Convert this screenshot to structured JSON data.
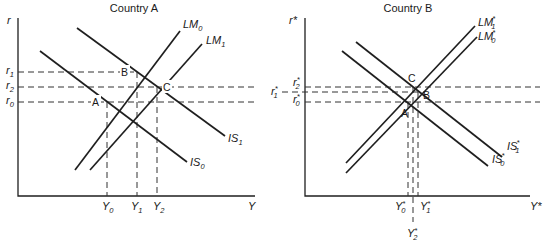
{
  "panels": [
    {
      "title": "Country A",
      "y_axis_label": "r",
      "x_axis_label": "Y",
      "curves": [
        {
          "name": "IS",
          "sub": "0"
        },
        {
          "name": "IS",
          "sub": "1"
        },
        {
          "name": "LM",
          "sub": "0"
        },
        {
          "name": "LM",
          "sub": "1"
        }
      ],
      "rate_levels": [
        {
          "name": "r",
          "sub": "1"
        },
        {
          "name": "r",
          "sub": "2"
        },
        {
          "name": "r",
          "sub": "0"
        }
      ],
      "output_levels": [
        {
          "name": "Y",
          "sub": "0"
        },
        {
          "name": "Y",
          "sub": "1"
        },
        {
          "name": "Y",
          "sub": "2"
        }
      ],
      "points": [
        "A",
        "B",
        "C"
      ]
    },
    {
      "title": "Country B",
      "y_axis_label": "r*",
      "x_axis_label": "Y*",
      "curves": [
        {
          "name": "IS",
          "sup": "*",
          "sub": "1"
        },
        {
          "name": "IS",
          "sup": "*",
          "sub": "0"
        },
        {
          "name": "LM",
          "sup": "*",
          "sub": "1"
        },
        {
          "name": "LM",
          "sup": "*",
          "sub": "0"
        }
      ],
      "rate_levels": [
        {
          "name": "r",
          "sup": "*",
          "sub": "2"
        },
        {
          "name": "r",
          "sup": "*",
          "sub": "1"
        },
        {
          "name": "r",
          "sup": "*",
          "sub": "0"
        }
      ],
      "output_levels": [
        {
          "name": "Y",
          "sup": "*",
          "sub": "0"
        },
        {
          "name": "Y",
          "sup": "*",
          "sub": "1"
        },
        {
          "name": "Y",
          "sup": "*",
          "sub": "2"
        }
      ],
      "points": [
        "A",
        "B",
        "C"
      ]
    }
  ]
}
